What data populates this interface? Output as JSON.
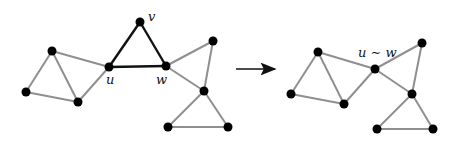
{
  "colors": {
    "background": "#ffffff",
    "node": "#000000",
    "edge_normal": "#8f8f8f",
    "edge_highlight": "#111111",
    "arrow": "#111111"
  },
  "labels": {
    "u": "u",
    "v": "v",
    "w": "w",
    "merged": "u ∼ w"
  },
  "left_graph": {
    "nodes": [
      {
        "id": "a",
        "x": 52,
        "y": 51
      },
      {
        "id": "b",
        "x": 26,
        "y": 92
      },
      {
        "id": "c",
        "x": 78,
        "y": 102
      },
      {
        "id": "u",
        "x": 109,
        "y": 67
      },
      {
        "id": "v",
        "x": 140,
        "y": 22
      },
      {
        "id": "w",
        "x": 166,
        "y": 66
      },
      {
        "id": "d",
        "x": 213,
        "y": 41
      },
      {
        "id": "e",
        "x": 204,
        "y": 91
      },
      {
        "id": "f",
        "x": 168,
        "y": 127
      },
      {
        "id": "g",
        "x": 228,
        "y": 127
      }
    ],
    "highlight_edges": [
      [
        "u",
        "v"
      ],
      [
        "v",
        "w"
      ],
      [
        "u",
        "w"
      ]
    ]
  },
  "right_graph": {
    "nodes": [
      {
        "id": "a",
        "x": 318,
        "y": 52
      },
      {
        "id": "b",
        "x": 291,
        "y": 94
      },
      {
        "id": "c",
        "x": 344,
        "y": 104
      },
      {
        "id": "uw",
        "x": 375,
        "y": 69
      },
      {
        "id": "d",
        "x": 422,
        "y": 43
      },
      {
        "id": "e",
        "x": 412,
        "y": 94
      },
      {
        "id": "f",
        "x": 377,
        "y": 129
      },
      {
        "id": "g",
        "x": 433,
        "y": 129
      }
    ]
  }
}
